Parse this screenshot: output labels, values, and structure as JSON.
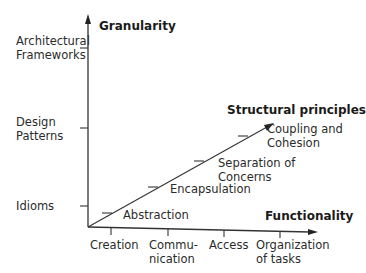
{
  "diagram": {
    "y_axis": {
      "title": "Granularity",
      "ticks": [
        {
          "label": "Architectural\nFrameworks"
        },
        {
          "label": "Design\nPatterns"
        },
        {
          "label": "Idioms"
        }
      ]
    },
    "x_axis": {
      "title": "Functionality",
      "ticks": [
        {
          "label": "Creation"
        },
        {
          "label": "Commu-\nnication"
        },
        {
          "label": "Access"
        },
        {
          "label": "Organization\nof tasks"
        }
      ]
    },
    "diagonal": {
      "title": "Structural principles",
      "steps": [
        {
          "label": "Abstraction"
        },
        {
          "label": "Encapsulation"
        },
        {
          "label": "Separation of\nConcerns"
        },
        {
          "label": "Coupling and\nCohesion"
        }
      ]
    },
    "colors": {
      "line": "#333333",
      "text": "#2b2b2b",
      "background": "#ffffff"
    }
  }
}
